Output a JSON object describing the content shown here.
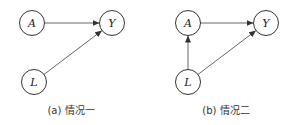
{
  "diagrams": [
    {
      "id": "a",
      "caption": "(a) 情况一",
      "nodes": {
        "A": {
          "label": "A"
        },
        "Y": {
          "label": "Y"
        },
        "L": {
          "label": "L"
        }
      },
      "edges": [
        {
          "from": "A",
          "to": "Y"
        },
        {
          "from": "L",
          "to": "Y"
        }
      ]
    },
    {
      "id": "b",
      "caption": "(b) 情况二",
      "nodes": {
        "A": {
          "label": "A"
        },
        "Y": {
          "label": "Y"
        },
        "L": {
          "label": "L"
        }
      },
      "edges": [
        {
          "from": "A",
          "to": "Y"
        },
        {
          "from": "L",
          "to": "A"
        },
        {
          "from": "L",
          "to": "Y"
        }
      ]
    }
  ]
}
